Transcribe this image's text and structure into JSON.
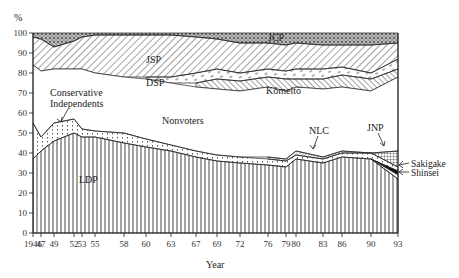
{
  "chart_data": {
    "type": "area",
    "title": "",
    "xlabel": "Year",
    "ylabel": "%",
    "ylim": [
      0,
      100
    ],
    "yticks": [
      0,
      10,
      20,
      30,
      40,
      50,
      60,
      70,
      80,
      90,
      100
    ],
    "x": [
      "1946",
      "47",
      "49",
      "52",
      "53",
      "55",
      "58",
      "60",
      "63",
      "67",
      "69",
      "72",
      "76",
      "79",
      "80",
      "83",
      "86",
      "90",
      "93"
    ],
    "stacking": "cumulative boundaries (top of each layer, %)",
    "series": [
      {
        "name": "LDP",
        "pattern": "vertical-lines",
        "top": [
          37,
          41,
          46,
          50,
          48,
          48,
          45,
          43,
          41,
          38,
          36,
          35,
          34,
          33,
          37,
          35,
          38,
          37,
          27
        ]
      },
      {
        "name": "Shinsei",
        "pattern": "blank",
        "top": [
          null,
          null,
          null,
          null,
          null,
          null,
          null,
          null,
          null,
          null,
          null,
          null,
          null,
          null,
          null,
          null,
          null,
          37,
          29
        ]
      },
      {
        "name": "Sakigake",
        "pattern": "solid-black",
        "top": [
          null,
          null,
          null,
          null,
          null,
          null,
          null,
          null,
          null,
          null,
          null,
          null,
          null,
          null,
          null,
          null,
          null,
          37,
          31
        ]
      },
      {
        "name": "Conservative Independents",
        "pattern": "dots",
        "top": [
          55,
          48,
          55,
          57,
          52,
          51,
          50,
          47,
          44,
          41,
          39,
          38,
          37,
          36,
          39,
          37,
          40,
          40,
          33
        ]
      },
      {
        "name": "NLC",
        "pattern": "fine-diagonal",
        "top": [
          null,
          null,
          null,
          null,
          null,
          null,
          null,
          null,
          null,
          null,
          null,
          null,
          38,
          37,
          41,
          38,
          41,
          40,
          null
        ]
      },
      {
        "name": "JNP",
        "pattern": "grid",
        "top": [
          null,
          null,
          null,
          null,
          null,
          null,
          null,
          null,
          null,
          null,
          null,
          null,
          null,
          null,
          null,
          null,
          null,
          40,
          42
        ]
      },
      {
        "name": "Nonvoters",
        "pattern": "blank",
        "top": [
          84,
          81,
          82,
          82,
          82,
          80,
          78,
          77,
          75,
          73,
          72,
          71,
          73,
          71,
          73,
          72,
          73,
          71,
          78
        ]
      },
      {
        "name": "Kōmeitō",
        "pattern": "diagonal-right",
        "top": [
          null,
          null,
          null,
          null,
          null,
          null,
          null,
          null,
          null,
          75,
          77,
          76,
          78,
          77,
          77,
          77,
          79,
          77,
          82
        ]
      },
      {
        "name": "DSP",
        "pattern": "dashes",
        "top": [
          null,
          null,
          null,
          null,
          null,
          null,
          null,
          78,
          78,
          80,
          82,
          80,
          82,
          81,
          82,
          82,
          83,
          80,
          87
        ]
      },
      {
        "name": "JSP",
        "pattern": "diagonal-left",
        "top": [
          98,
          97,
          93,
          96,
          98,
          99,
          99,
          99,
          99,
          98,
          97,
          95,
          95,
          94,
          95,
          94,
          94,
          94,
          95
        ]
      },
      {
        "name": "JCP",
        "pattern": "crosshatch",
        "top": [
          100,
          100,
          100,
          100,
          100,
          100,
          100,
          100,
          100,
          100,
          100,
          100,
          100,
          100,
          100,
          100,
          100,
          100,
          100
        ]
      }
    ],
    "annotations": [
      "JCP",
      "JSP",
      "DSP",
      "Kōmeitō",
      "Nonvoters",
      "Conservative Independents",
      "LDP",
      "NLC",
      "JNP",
      "Sakigake",
      "Shinsei"
    ],
    "grid": false,
    "legend": "inline labels"
  },
  "axis": {
    "y_unit": "%",
    "x_title": "Year",
    "y_ticks": [
      "0",
      "10",
      "20",
      "30",
      "40",
      "50",
      "60",
      "70",
      "80",
      "90",
      "100"
    ],
    "x_ticks": [
      "1946",
      "47",
      "49",
      "52",
      "53",
      "55",
      "58",
      "60",
      "63",
      "67",
      "69",
      "72",
      "76",
      "79",
      "80",
      "83",
      "86",
      "90",
      "93"
    ]
  },
  "labels": {
    "jcp": "JCP",
    "jsp": "JSP",
    "dsp": "DSP",
    "komeito": "Kōmeitō",
    "nonvoters": "Nonvoters",
    "cons_ind_1": "Conservative",
    "cons_ind_2": "Independents",
    "ldp": "LDP",
    "nlc": "NLC",
    "jnp": "JNP",
    "sakigake": "Sakigake",
    "shinsei": "Shinsei"
  }
}
